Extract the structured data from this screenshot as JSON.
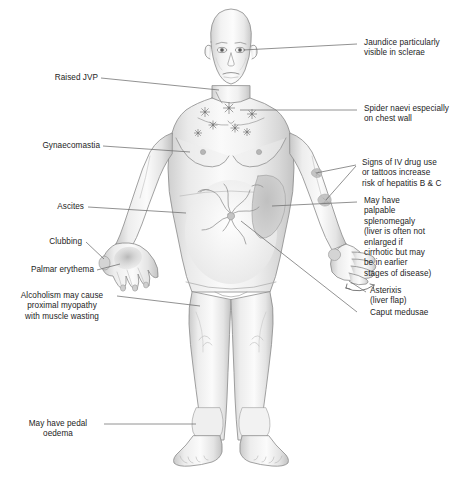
{
  "figure": {
    "background_color": "#ffffff",
    "line_color": "#6e6e6e",
    "text_color": "#1d1d1d",
    "skin_light": "#f3f3f3",
    "skin_mid": "#e2e2e2",
    "skin_shadow": "#c9c9c9",
    "skin_dark": "#b0b0b0"
  },
  "labels": {
    "jaundice": "Jaundice particularly\nvisible in sclerae",
    "spider_naevi": "Spider naevi especially\non chest wall",
    "iv_drug_use": "Signs of IV drug use\nor tattoos increase\nrisk of hepatitis B & C",
    "splenomegaly": "May have\npalpable\nsplenomegaly\n(liver is often not\nenlarged if\ncirrhotic but may\nbe in earlier\nstages of disease)",
    "asterixis": "Asterixis\n(liver flap)",
    "caput_medusae": "Caput medusae",
    "raised_jvp": "Raised JVP",
    "gynaecomastia": "Gynaecomastia",
    "ascites": "Ascites",
    "clubbing": "Clubbing",
    "palmar_erythema": "Palmar erythema",
    "alcoholism": "Alcoholism may cause\nproximal myopathy\nwith muscle wasting",
    "pedal_oedema": "May have pedal\noedema"
  },
  "annotations": {
    "spider_naevi_count": 7,
    "tattoo_marks": 2,
    "asterixis_arrows": 2
  }
}
